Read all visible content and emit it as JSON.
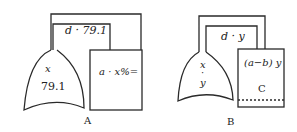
{
  "figures": [
    {
      "id": "A",
      "caption": "A",
      "tube_label": "d · 79.1",
      "flask_labels": [
        "x",
        "79.1"
      ],
      "box_label": "a · x%="
    },
    {
      "id": "B",
      "caption": "B",
      "tube_label": "d · y",
      "flask_labels": [
        "x",
        "·",
        "y"
      ],
      "box_label": "(a−b) y",
      "box_sublabel": "C"
    }
  ],
  "colors": {
    "stroke": "#2a2a2a",
    "background": "#ffffff"
  }
}
